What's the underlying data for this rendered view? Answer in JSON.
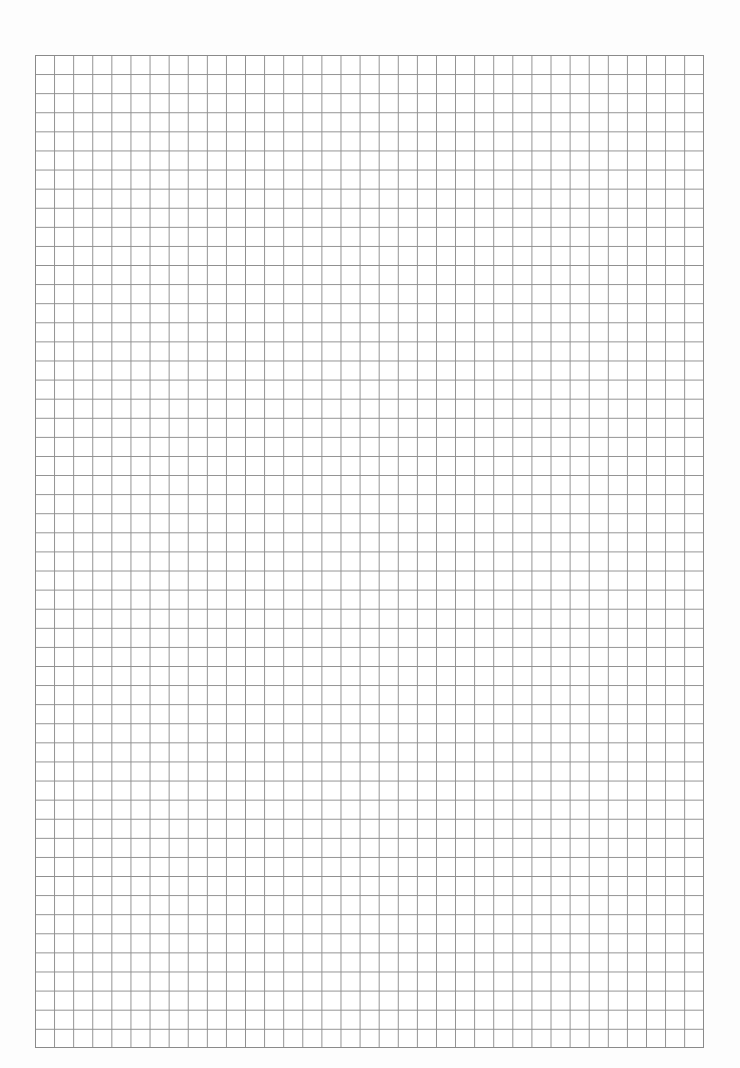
{
  "document": {
    "type": "grid paper",
    "grid": {
      "columns": 35,
      "rows": 52,
      "line_color": "#8f8f8f",
      "background": "#ffffff"
    }
  }
}
